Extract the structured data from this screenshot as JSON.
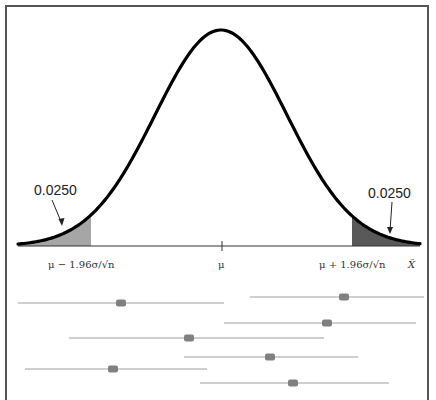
{
  "diagram": {
    "type": "normal-distribution-confidence-intervals",
    "tail_labels": {
      "left": "0.0250",
      "right": "0.0250"
    },
    "axis_labels": {
      "left": "μ − 1.96σ/√n",
      "center": "μ",
      "right": "μ + 1.96σ/√n",
      "variable": "X̄"
    },
    "colors": {
      "curve": "#000000",
      "left_tail": "#a6a6a6",
      "right_tail": "#595959",
      "interval_line": "#bfbfbf",
      "interval_marker": "#808080",
      "frame": "#555555"
    },
    "intervals": [
      {
        "x1": 18,
        "x2": 224,
        "marker": 121,
        "y": 303
      },
      {
        "x1": 250,
        "x2": 424,
        "marker": 344,
        "y": 297
      },
      {
        "x1": 224,
        "x2": 416,
        "marker": 327,
        "y": 323
      },
      {
        "x1": 69,
        "x2": 324,
        "marker": 189,
        "y": 338
      },
      {
        "x1": 184,
        "x2": 358,
        "marker": 270,
        "y": 357
      },
      {
        "x1": 25,
        "x2": 207,
        "marker": 113,
        "y": 369
      },
      {
        "x1": 200,
        "x2": 389,
        "marker": 293,
        "y": 383
      }
    ]
  }
}
